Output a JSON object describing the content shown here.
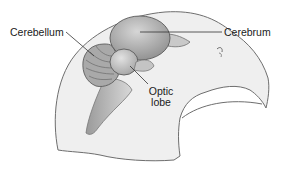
{
  "diagram": {
    "labels": {
      "cerebellum": "Cerebellum",
      "cerebrum": "Cerebrum",
      "optic_lobe_line1": "Optic",
      "optic_lobe_line2": "lobe"
    },
    "colors": {
      "background": "#ffffff",
      "head_fill": "#efefef",
      "outline": "#6e6e6e",
      "brain_fill": "#b8b8b8",
      "brain_dark": "#8f8f8f",
      "leader_line": "#333333",
      "text": "#1a1a1a"
    }
  }
}
